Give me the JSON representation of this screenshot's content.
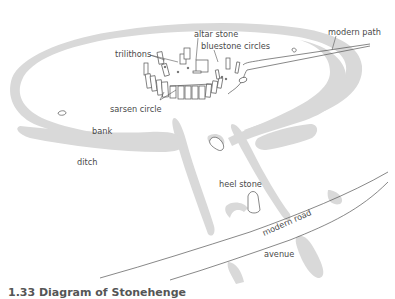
{
  "diagram": {
    "colors": {
      "earthwork": "#d9d9d9",
      "outline": "#555555",
      "label": "#4a4a4a",
      "background": "#ffffff"
    },
    "labels": {
      "trilithons": "trilithons",
      "altar_stone": "altar stone",
      "bluestone_circles": "bluestone circles",
      "modern_path": "modern path",
      "sarsen_circle": "sarsen circle",
      "bank": "bank",
      "ditch": "ditch",
      "heel_stone": "heel stone",
      "modern_road": "modern road",
      "avenue": "avenue"
    },
    "caption": "1.33  Diagram of Stonehenge"
  }
}
